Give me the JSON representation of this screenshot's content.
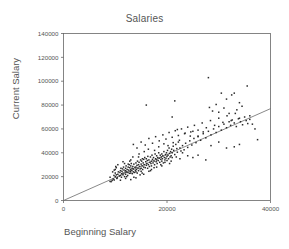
{
  "chart_data": {
    "type": "scatter",
    "title": "Salaries",
    "xlabel": "Beginning Salary",
    "ylabel": "Current Salary",
    "xlim": [
      0,
      40000
    ],
    "ylim": [
      0,
      140000
    ],
    "xticks": [
      0,
      20000,
      40000
    ],
    "yticks": [
      0,
      20000,
      40000,
      60000,
      80000,
      100000,
      120000,
      140000
    ],
    "xtick_labels": [
      "0",
      "20000",
      "40000"
    ],
    "ytick_labels": [
      "0",
      "20000",
      "40000",
      "60000",
      "80000",
      "100000",
      "120000",
      "140000"
    ],
    "grid": false,
    "legend": "none",
    "marker": "square",
    "marker_color": "#2b2b2b",
    "frame_color": "#666666",
    "fit_line": {
      "type": "linear-regression",
      "color": "#6b6b6b",
      "x_start": 0,
      "y_start": 0,
      "x_end": 40000,
      "y_end": 77000,
      "slope": 1.925,
      "intercept": 0
    },
    "points": [
      [
        9000,
        16000
      ],
      [
        9200,
        15800
      ],
      [
        9400,
        16800
      ],
      [
        9600,
        18000
      ],
      [
        9000,
        19500
      ],
      [
        9750,
        21000
      ],
      [
        9800,
        17200
      ],
      [
        10000,
        20000
      ],
      [
        10200,
        21500
      ],
      [
        10000,
        23000
      ],
      [
        10400,
        19000
      ],
      [
        10500,
        22000
      ],
      [
        10600,
        24000
      ],
      [
        10000,
        26000
      ],
      [
        10200,
        27500
      ],
      [
        10800,
        20500
      ],
      [
        10900,
        23500
      ],
      [
        11000,
        21000
      ],
      [
        11000,
        25000
      ],
      [
        11100,
        27000
      ],
      [
        11200,
        19500
      ],
      [
        11250,
        22500
      ],
      [
        11300,
        24500
      ],
      [
        11400,
        26500
      ],
      [
        11500,
        21500
      ],
      [
        11500,
        23000
      ],
      [
        11600,
        28000
      ],
      [
        11700,
        25500
      ],
      [
        11800,
        20000
      ],
      [
        11900,
        23800
      ],
      [
        12000,
        22000
      ],
      [
        12000,
        25000
      ],
      [
        12000,
        27000
      ],
      [
        12100,
        29000
      ],
      [
        12200,
        24000
      ],
      [
        12300,
        26000
      ],
      [
        12400,
        21000
      ],
      [
        12450,
        23500
      ],
      [
        12500,
        28000
      ],
      [
        12600,
        25500
      ],
      [
        12700,
        30000
      ],
      [
        12750,
        22800
      ],
      [
        12800,
        27500
      ],
      [
        12900,
        24500
      ],
      [
        13000,
        23000
      ],
      [
        13000,
        26000
      ],
      [
        13000,
        29000
      ],
      [
        13100,
        31000
      ],
      [
        13200,
        25000
      ],
      [
        13250,
        27000
      ],
      [
        13300,
        22500
      ],
      [
        13400,
        28500
      ],
      [
        13500,
        24000
      ],
      [
        13500,
        26500
      ],
      [
        13600,
        30500
      ],
      [
        13700,
        23500
      ],
      [
        13800,
        27800
      ],
      [
        13900,
        25200
      ],
      [
        14000,
        24000
      ],
      [
        14000,
        28000
      ],
      [
        14000,
        31500
      ],
      [
        14100,
        26000
      ],
      [
        14200,
        29500
      ],
      [
        14250,
        23000
      ],
      [
        14300,
        33000
      ],
      [
        14400,
        27000
      ],
      [
        14500,
        25000
      ],
      [
        14500,
        30000
      ],
      [
        14600,
        32000
      ],
      [
        14700,
        28500
      ],
      [
        14800,
        26500
      ],
      [
        14900,
        34000
      ],
      [
        15000,
        27000
      ],
      [
        15000,
        30500
      ],
      [
        15000,
        24500
      ],
      [
        15100,
        33000
      ],
      [
        15200,
        29000
      ],
      [
        15250,
        35000
      ],
      [
        15300,
        26000
      ],
      [
        15400,
        31500
      ],
      [
        15500,
        28000
      ],
      [
        15500,
        34500
      ],
      [
        15600,
        30000
      ],
      [
        15700,
        36000
      ],
      [
        15800,
        27500
      ],
      [
        15900,
        32500
      ],
      [
        16000,
        29500
      ],
      [
        16000,
        35000
      ],
      [
        16100,
        31000
      ],
      [
        16200,
        33500
      ],
      [
        16250,
        27000
      ],
      [
        16300,
        37000
      ],
      [
        16400,
        30000
      ],
      [
        16500,
        34000
      ],
      [
        16600,
        28500
      ],
      [
        16700,
        32000
      ],
      [
        16800,
        36500
      ],
      [
        16900,
        31000
      ],
      [
        17000,
        33000
      ],
      [
        17000,
        29000
      ],
      [
        17100,
        38000
      ],
      [
        17200,
        34500
      ],
      [
        17300,
        31500
      ],
      [
        17400,
        36000
      ],
      [
        17500,
        33000
      ],
      [
        17600,
        30000
      ],
      [
        17700,
        39000
      ],
      [
        17800,
        35000
      ],
      [
        17900,
        32500
      ],
      [
        18000,
        34000
      ],
      [
        18000,
        37500
      ],
      [
        18100,
        31000
      ],
      [
        18200,
        36000
      ],
      [
        18300,
        33500
      ],
      [
        18400,
        40000
      ],
      [
        18500,
        35500
      ],
      [
        18600,
        32000
      ],
      [
        18700,
        38000
      ],
      [
        18800,
        34500
      ],
      [
        18900,
        36500
      ],
      [
        19000,
        33000
      ],
      [
        19000,
        39000
      ],
      [
        19100,
        35000
      ],
      [
        19200,
        37500
      ],
      [
        19300,
        31500
      ],
      [
        19400,
        41000
      ],
      [
        19500,
        36000
      ],
      [
        19600,
        34000
      ],
      [
        19700,
        38500
      ],
      [
        19800,
        35500
      ],
      [
        19900,
        40000
      ],
      [
        20000,
        37000
      ],
      [
        20000,
        33500
      ],
      [
        20100,
        42000
      ],
      [
        20200,
        38000
      ],
      [
        20300,
        35000
      ],
      [
        20400,
        44000
      ],
      [
        20500,
        39500
      ],
      [
        20600,
        36500
      ],
      [
        20700,
        41000
      ],
      [
        20800,
        37500
      ],
      [
        20900,
        43000
      ],
      [
        21000,
        40000
      ],
      [
        21000,
        36000
      ],
      [
        21200,
        45500
      ],
      [
        21300,
        42000
      ],
      [
        21500,
        38500
      ],
      [
        21700,
        47000
      ],
      [
        21900,
        43500
      ],
      [
        22000,
        40500
      ],
      [
        22200,
        49000
      ],
      [
        22500,
        44000
      ],
      [
        22700,
        41500
      ],
      [
        23000,
        46000
      ],
      [
        23300,
        42500
      ],
      [
        23600,
        48000
      ],
      [
        24000,
        44500
      ],
      [
        24400,
        50000
      ],
      [
        24800,
        46500
      ],
      [
        25200,
        52000
      ],
      [
        25600,
        48500
      ],
      [
        26000,
        54000
      ],
      [
        26500,
        50500
      ],
      [
        27000,
        56000
      ],
      [
        27500,
        52500
      ],
      [
        28000,
        58000
      ],
      [
        28500,
        55000
      ],
      [
        29000,
        60000
      ],
      [
        29500,
        57000
      ],
      [
        30000,
        62000
      ],
      [
        30500,
        59000
      ],
      [
        31000,
        64000
      ],
      [
        31500,
        61000
      ],
      [
        32000,
        66000
      ],
      [
        32300,
        63000
      ],
      [
        32600,
        67500
      ],
      [
        33000,
        65000
      ],
      [
        33400,
        62000
      ],
      [
        33800,
        68500
      ],
      [
        34200,
        66000
      ],
      [
        34600,
        63500
      ],
      [
        35000,
        70000
      ],
      [
        35300,
        67000
      ],
      [
        35600,
        64500
      ],
      [
        36000,
        68000
      ],
      [
        13500,
        47000
      ],
      [
        14200,
        44000
      ],
      [
        15000,
        49000
      ],
      [
        15800,
        46500
      ],
      [
        16500,
        52000
      ],
      [
        17200,
        48000
      ],
      [
        17800,
        53500
      ],
      [
        18500,
        50000
      ],
      [
        19200,
        55000
      ],
      [
        19800,
        51500
      ],
      [
        20400,
        57000
      ],
      [
        21000,
        53000
      ],
      [
        21600,
        58500
      ],
      [
        22200,
        54500
      ],
      [
        22800,
        60000
      ],
      [
        23400,
        56000
      ],
      [
        24000,
        61500
      ],
      [
        24600,
        57500
      ],
      [
        25300,
        63000
      ],
      [
        26000,
        59000
      ],
      [
        26800,
        65000
      ],
      [
        27600,
        61000
      ],
      [
        28400,
        67000
      ],
      [
        29200,
        63000
      ],
      [
        30000,
        69000
      ],
      [
        30800,
        65500
      ],
      [
        31600,
        71000
      ],
      [
        32400,
        67000
      ],
      [
        33200,
        73000
      ],
      [
        34000,
        69000
      ],
      [
        16000,
        80000
      ],
      [
        21500,
        83500
      ],
      [
        21000,
        70000
      ],
      [
        22000,
        59500
      ],
      [
        23500,
        56500
      ],
      [
        24500,
        54000
      ],
      [
        25000,
        58000
      ],
      [
        26000,
        53500
      ],
      [
        27000,
        57500
      ],
      [
        28000,
        103000
      ],
      [
        28200,
        78000
      ],
      [
        28800,
        75000
      ],
      [
        29500,
        80500
      ],
      [
        30000,
        74000
      ],
      [
        30500,
        90000
      ],
      [
        31000,
        77500
      ],
      [
        31500,
        85000
      ],
      [
        32000,
        73000
      ],
      [
        32500,
        88500
      ],
      [
        33000,
        90000
      ],
      [
        33500,
        76000
      ],
      [
        34000,
        82000
      ],
      [
        34500,
        79000
      ],
      [
        35500,
        96000
      ],
      [
        36000,
        71000
      ],
      [
        36500,
        64000
      ],
      [
        37000,
        60000
      ],
      [
        37500,
        51000
      ],
      [
        34000,
        47000
      ],
      [
        33000,
        45000
      ],
      [
        31500,
        44000
      ],
      [
        30000,
        49000
      ],
      [
        28500,
        46000
      ],
      [
        27500,
        34000
      ],
      [
        26000,
        38000
      ],
      [
        25000,
        36000
      ],
      [
        24000,
        37500
      ],
      [
        23000,
        40000
      ],
      [
        22500,
        35000
      ],
      [
        21800,
        36500
      ],
      [
        10500,
        30000
      ],
      [
        11500,
        32500
      ],
      [
        12500,
        30500
      ],
      [
        13000,
        34000
      ],
      [
        14500,
        36500
      ],
      [
        12000,
        18500
      ],
      [
        13000,
        17500
      ],
      [
        14000,
        19000
      ],
      [
        11000,
        17000
      ],
      [
        10300,
        18500
      ],
      [
        15500,
        22000
      ],
      [
        16500,
        24500
      ],
      [
        17000,
        26000
      ],
      [
        18000,
        28000
      ],
      [
        19000,
        29000
      ],
      [
        20500,
        31000
      ],
      [
        9500,
        24000
      ],
      [
        9800,
        25500
      ],
      [
        10100,
        28500
      ],
      [
        12200,
        20000
      ],
      [
        13600,
        19500
      ],
      [
        14800,
        21500
      ],
      [
        15200,
        23000
      ],
      [
        16800,
        25000
      ],
      [
        17500,
        27500
      ],
      [
        18800,
        30000
      ],
      [
        19600,
        32000
      ],
      [
        20800,
        33000
      ],
      [
        11800,
        31000
      ],
      [
        12800,
        33000
      ],
      [
        13400,
        36500
      ],
      [
        14600,
        39000
      ],
      [
        15600,
        41000
      ],
      [
        16400,
        43000
      ],
      [
        17600,
        42000
      ],
      [
        18400,
        45000
      ],
      [
        19400,
        47500
      ],
      [
        20200,
        46000
      ],
      [
        21200,
        48500
      ],
      [
        22400,
        50500
      ]
    ]
  }
}
